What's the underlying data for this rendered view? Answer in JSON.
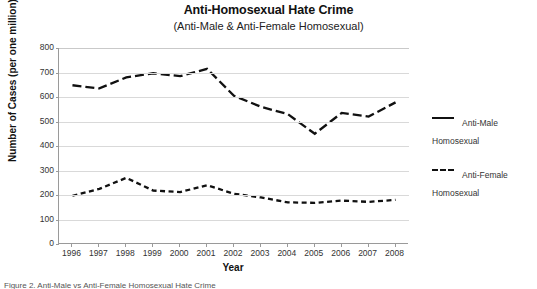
{
  "title": "Anti-Homosexual Hate Crime",
  "subtitle": "(Anti-Male & Anti-Female Homosexual)",
  "axis": {
    "xlabel": "Year",
    "ylabel": "Number of Cases (per one million)"
  },
  "legend": {
    "entries": [
      {
        "label": "Anti-Male\nHomosexual",
        "style": "solid"
      },
      {
        "label": "Anti-Female\nHomosexual",
        "style": "dashed"
      }
    ],
    "male_label": "Anti-Male Homosexual",
    "female_label": "Anti-Female Homosexual"
  },
  "footer": "Figure 2. Anti-Male vs Anti-Female Homosexual Hate Crime",
  "chart_data": {
    "type": "line",
    "title": "Anti-Homosexual Hate Crime",
    "subtitle": "(Anti-Male & Anti-Female Homosexual)",
    "xlabel": "Year",
    "ylabel": "Number of Cases (per one million)",
    "categories": [
      1996,
      1997,
      1998,
      1999,
      2000,
      2001,
      2002,
      2003,
      2004,
      2005,
      2006,
      2007,
      2008
    ],
    "xtick_labels": [
      "1996",
      "1997",
      "1998",
      "1999",
      "2000",
      "2001",
      "2002",
      "2003",
      "2004",
      "2005",
      "2006",
      "2007",
      "2008"
    ],
    "ylim": [
      0,
      800
    ],
    "ytick_values": [
      0,
      100,
      200,
      300,
      400,
      500,
      600,
      700,
      800
    ],
    "ytick_labels": [
      "0",
      "100",
      "200",
      "300",
      "400",
      "500",
      "600",
      "700",
      "800"
    ],
    "grid": true,
    "grid_axis": "y",
    "legend_position": "right",
    "series": [
      {
        "name": "Anti-Male Homosexual",
        "style": "solid",
        "color": "#111111",
        "values": [
          648,
          635,
          680,
          697,
          685,
          715,
          605,
          560,
          530,
          450,
          535,
          520,
          578
        ]
      },
      {
        "name": "Anti-Female Homosexual",
        "style": "dashed",
        "color": "#111111",
        "values": [
          197,
          225,
          270,
          218,
          212,
          240,
          205,
          190,
          170,
          168,
          177,
          172,
          180
        ]
      }
    ]
  }
}
